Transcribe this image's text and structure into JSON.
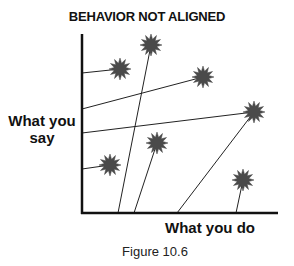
{
  "title": "BEHAVIOR NOT ALIGNED",
  "y_axis_label": "What you say",
  "x_axis_label": "What you do",
  "caption": "Figure 10.6",
  "colors": {
    "star": "#4a4a4a",
    "axis": "#111111",
    "line": "#222222"
  },
  "axes": {
    "origin": [
      82,
      213
    ],
    "y_top": 34,
    "x_right": 278
  },
  "stars": [
    {
      "id": 1,
      "cx": 120,
      "cy": 69,
      "anchor_axis": "y",
      "anchor": [
        82,
        73
      ]
    },
    {
      "id": 2,
      "cx": 151,
      "cy": 45,
      "anchor_axis": "x",
      "anchor": [
        118,
        213
      ]
    },
    {
      "id": 3,
      "cx": 203,
      "cy": 77,
      "anchor_axis": "y",
      "anchor": [
        82,
        109
      ]
    },
    {
      "id": 4,
      "cx": 254,
      "cy": 112,
      "anchor_axis": "y",
      "anchor": [
        82,
        133
      ]
    },
    {
      "id": 4,
      "cx": 254,
      "cy": 112,
      "anchor_axis": "x",
      "anchor": [
        177,
        213
      ]
    },
    {
      "id": 5,
      "cx": 110,
      "cy": 165,
      "anchor_axis": "y",
      "anchor": [
        82,
        169
      ]
    },
    {
      "id": 6,
      "cx": 157,
      "cy": 143,
      "anchor_axis": "x",
      "anchor": [
        134,
        213
      ]
    },
    {
      "id": 7,
      "cx": 243,
      "cy": 180,
      "anchor_axis": "x",
      "anchor": [
        236,
        213
      ]
    }
  ]
}
